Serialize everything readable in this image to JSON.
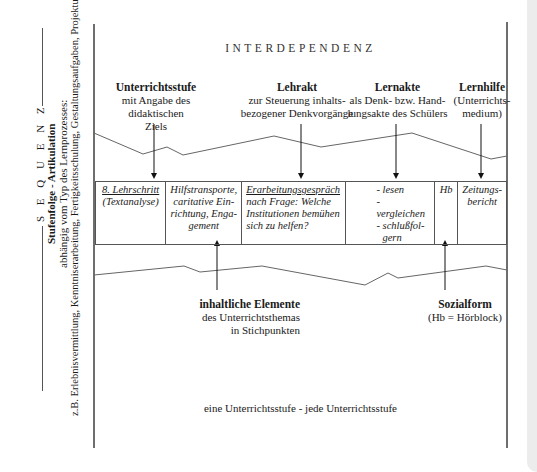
{
  "side": {
    "sequenz": "S E Q U E N Z",
    "stufenfolge": "Stufenfolge  -  Artikulation",
    "abhaengig": "abhängig vom Typ des Lernprozesses:",
    "beispiele": "z.B. Erlebnisvermittlung, Kenntniserarbeitung, Fertigkeitsschulung, Gestaltungsaufgaben, Projektunterricht"
  },
  "title": "INTERDEPENDENZ",
  "top_headings": [
    {
      "bold": "Unterrichtsstufe",
      "lines": [
        "mit Angabe des didaktischen",
        "Ziels"
      ]
    },
    {
      "bold": "Lehrakt",
      "lines": [
        "zur Steuerung inhalts-",
        "bezogener Denkvorgänge"
      ]
    },
    {
      "bold": "Lernakte",
      "lines": [
        "als Denk- bzw. Hand-",
        "lungsakte des Schülers"
      ]
    },
    {
      "bold": "Lernhilfe",
      "lines": [
        "(Unterrichts-",
        "medium)"
      ]
    }
  ],
  "row": {
    "cells": [
      {
        "underlined": "8. Lehrschritt",
        "lines": [
          "(Textanalyse)"
        ]
      },
      {
        "lines": [
          "Hilfstransporte,",
          "caritative Ein-",
          "richtung, Enga-",
          "gement"
        ]
      },
      {
        "underlined": "Erarbeitungsgespräch",
        "lines": [
          "nach Frage: Welche",
          "Institutionen bemühen",
          "sich zu helfen?"
        ]
      },
      {
        "lines": [
          "- lesen",
          "- vergleichen",
          "- schlußfol-",
          "  gern"
        ]
      },
      {
        "lines": [
          "Hb"
        ]
      },
      {
        "lines": [
          "Zeitungs-",
          "bericht"
        ]
      }
    ]
  },
  "bottom_headings": [
    {
      "bold": "inhaltliche Elemente",
      "lines": [
        "des Unterrichtsthemas",
        "in Stichpunkten"
      ]
    },
    {
      "bold": "Sozialform",
      "lines": [
        "(Hb = Hörblock)"
      ]
    }
  ],
  "footer": "eine Unterrichtsstufe  -  jede Unterrichtsstufe",
  "colors": {
    "line": "#555555",
    "frame": "#6e6e6e",
    "text": "#1a1a1a"
  }
}
